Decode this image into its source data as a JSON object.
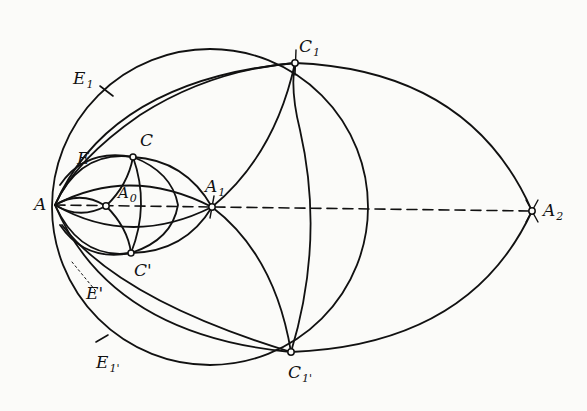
{
  "diagram": {
    "type": "geometric-construction",
    "stroke_color": "#111111",
    "background": "#fbfbf9",
    "points": [
      {
        "id": "A",
        "label": "A",
        "sub": "",
        "x": 55,
        "y": 205
      },
      {
        "id": "A0",
        "label": "A",
        "sub": "0",
        "x": 106,
        "y": 206
      },
      {
        "id": "A1",
        "label": "A",
        "sub": "1",
        "x": 212,
        "y": 207
      },
      {
        "id": "A2",
        "label": "A",
        "sub": "2",
        "x": 532,
        "y": 211
      },
      {
        "id": "C",
        "label": "C",
        "sub": "",
        "x": 133,
        "y": 157
      },
      {
        "id": "Cp",
        "label": "C'",
        "sub": "",
        "x": 131,
        "y": 253
      },
      {
        "id": "C1",
        "label": "C",
        "sub": "1",
        "x": 295,
        "y": 63
      },
      {
        "id": "C1p",
        "label": "C",
        "sub": "1'",
        "x": 291,
        "y": 352
      },
      {
        "id": "E",
        "label": "E",
        "sub": "",
        "x": 85,
        "y": 163
      },
      {
        "id": "Ep",
        "label": "E'",
        "sub": "",
        "x": 90,
        "y": 285
      },
      {
        "id": "E1",
        "label": "E",
        "sub": "1",
        "x": 100,
        "y": 90
      },
      {
        "id": "E1p",
        "label": "E",
        "sub": "1'",
        "x": 100,
        "y": 330
      }
    ],
    "labels": {
      "A": "A",
      "A0": "A",
      "A0_sub": "0",
      "A1": "A",
      "A1_sub": "1",
      "A2": "A",
      "A2_sub": "2",
      "C": "C",
      "Cp": "C'",
      "C1": "C",
      "C1_sub": "1",
      "C1p": "C",
      "C1p_sub": "1'",
      "E": "E",
      "Ep": "E'",
      "E1": "E",
      "E1_sub": "1",
      "E1p": "E",
      "E1p_sub": "1'"
    },
    "axis": {
      "style": "dashed",
      "from": "A",
      "to": "A2"
    }
  }
}
